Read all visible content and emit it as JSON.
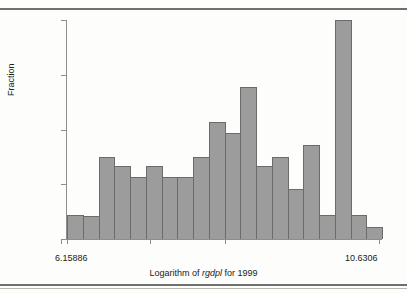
{
  "chart_data": {
    "type": "bar",
    "title": "",
    "subtitle": "",
    "xlabel": "Logarithm of rgdpl for 1999",
    "xlabel_parts": {
      "pre": "Logarithm of ",
      "italic": "rgdpl",
      "post": " for 1999"
    },
    "ylabel": "Fraction",
    "xlim": [
      6.15886,
      10.6306
    ],
    "ylim": [
      0,
      0.144
    ],
    "grid": false,
    "legend": null,
    "x_tick_labels": [
      "6.15886",
      "10.6306"
    ],
    "y_tick_labels": [
      "0.144",
      "0"
    ],
    "y_tick_values": [
      0.144,
      0.108,
      0.072,
      0.036,
      0
    ],
    "x_tick_positions": [
      6.15886,
      6.9,
      7.65,
      8.4,
      9.15,
      9.9,
      10.6306
    ],
    "n_bins": 20,
    "bin_edges": [
      6.15886,
      6.3823,
      6.6058,
      6.8292,
      7.0527,
      7.2762,
      7.4996,
      7.7231,
      7.9466,
      8.17,
      8.3935,
      8.617,
      8.8404,
      9.0639,
      9.2874,
      9.5108,
      9.7343,
      9.9578,
      10.1812,
      10.4047,
      10.6306
    ],
    "categories": [
      "6.27",
      "6.49",
      "6.72",
      "6.94",
      "7.16",
      "7.39",
      "7.61",
      "7.83",
      "8.06",
      "8.28",
      "8.51",
      "8.73",
      "8.95",
      "9.18",
      "9.40",
      "9.62",
      "9.85",
      "10.07",
      "10.29",
      "10.52"
    ],
    "values": [
      0.016,
      0.015,
      0.054,
      0.048,
      0.041,
      0.048,
      0.041,
      0.041,
      0.054,
      0.077,
      0.07,
      0.1,
      0.048,
      0.054,
      0.033,
      0.062,
      0.016,
      0.144,
      0.016,
      0.008
    ],
    "bar_color": "#9c9c9c",
    "bar_edge_color": "#6b6b6b",
    "axis_color": "#8d8d8a",
    "background": "#fdfdfb"
  }
}
